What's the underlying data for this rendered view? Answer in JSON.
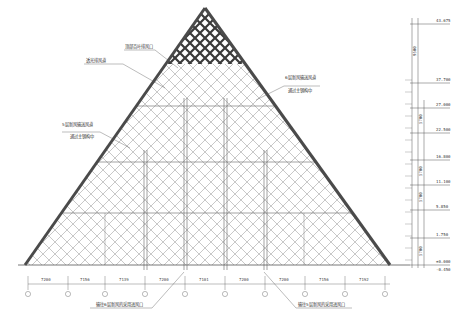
{
  "drawing": {
    "title": "Pyramid glass facade elevation",
    "annotations": [
      {
        "id": "top-louver",
        "text": "顶部百叶排风口"
      },
      {
        "id": "apex-vent",
        "text": "透光排风道"
      },
      {
        "id": "right-duct",
        "line1": "6层新风输送风道",
        "line2": "通过主钢构中"
      },
      {
        "id": "left-duct",
        "line1": "5层新风输送风道",
        "line2": "通过主钢构中"
      },
      {
        "id": "bottom-left-inlet",
        "text": "输往6层新风的采用进风口"
      },
      {
        "id": "bottom-right-inlet",
        "text": "输往5层新风的采用进风口"
      }
    ],
    "bottom_dimensions": [
      "7200",
      "7156",
      "7139",
      "7200",
      "7101",
      "7200",
      "7200",
      "7156",
      "7192"
    ],
    "axis_markers": [
      "⑤",
      "⑥",
      "⑦",
      "⑧",
      "⑨",
      "⑩",
      "⑪",
      "⑫",
      "⑬",
      "⑭"
    ],
    "elevations": [
      "43.675",
      "37.700",
      "27.000",
      "22.500",
      "16.800",
      "11.100",
      "5.850",
      "1.750",
      "±0.000",
      "-0.450"
    ],
    "vertical_dimensions": [
      "9500",
      "5700",
      "5700",
      "5700",
      "5700"
    ],
    "colors": {
      "line": "#555555",
      "frame": "#4a4a4a",
      "grid": "#9a9a9a",
      "dark_grid": "#3a3a3a"
    }
  }
}
